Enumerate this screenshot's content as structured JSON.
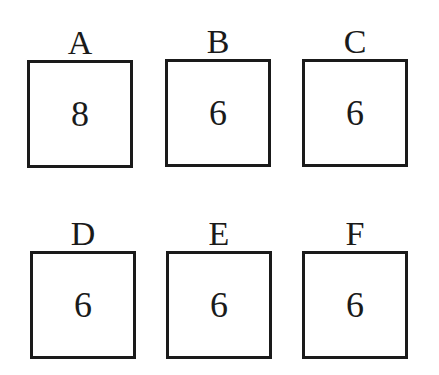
{
  "boxes": [
    {
      "label": "A",
      "value": "8"
    },
    {
      "label": "B",
      "value": "6"
    },
    {
      "label": "C",
      "value": "6"
    },
    {
      "label": "D",
      "value": "6"
    },
    {
      "label": "E",
      "value": "6"
    },
    {
      "label": "F",
      "value": "6"
    }
  ]
}
